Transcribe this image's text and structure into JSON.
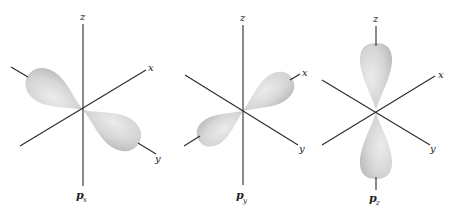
{
  "diagram": {
    "panels": [
      {
        "id": "px",
        "orbital_label": "p",
        "orbital_subscript": "x",
        "axis_labels": {
          "z": "z",
          "x": "x",
          "y": "y"
        },
        "lobe_axis": "x"
      },
      {
        "id": "py",
        "orbital_label": "p",
        "orbital_subscript": "y",
        "axis_labels": {
          "z": "z",
          "x": "x",
          "y": "y"
        },
        "lobe_axis": "y"
      },
      {
        "id": "pz",
        "orbital_label": "p",
        "orbital_subscript": "z",
        "axis_labels": {
          "z": "z",
          "x": "x",
          "y": "y"
        },
        "lobe_axis": "z"
      }
    ],
    "colors": {
      "axis": "#2a2a2a",
      "lobe_light": "#e6e6e6",
      "lobe_dark": "#bdbdbd",
      "background": "#ffffff"
    }
  }
}
